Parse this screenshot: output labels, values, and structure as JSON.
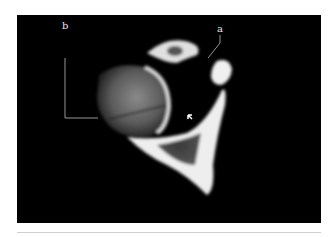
{
  "figure": {
    "labels": [
      {
        "id": "a",
        "text": "a"
      },
      {
        "id": "b",
        "text": "b"
      }
    ],
    "arrow": "small white arrow pointing to fracture line on humeral head"
  }
}
